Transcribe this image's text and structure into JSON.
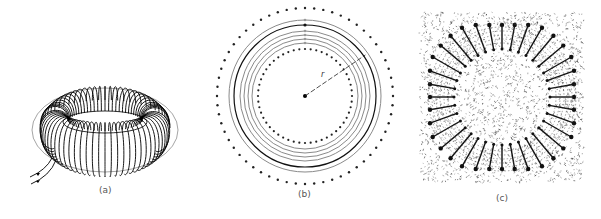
{
  "figure": {
    "panels": [
      {
        "id": "a",
        "label": "(a)",
        "description": "Toroidal coil with closely wound turns and two lead wires"
      },
      {
        "id": "b",
        "label": "(b)",
        "description": "Cross-section of toroid: concentric field lines between inner and outer rings of wire dots, radius r marked from center",
        "radius_label": "r",
        "field_lines": 6,
        "highlighted_line": 3
      },
      {
        "id": "c",
        "label": "(c)",
        "description": "Iron-filings pattern showing magnetic field inside a toroid"
      }
    ]
  }
}
